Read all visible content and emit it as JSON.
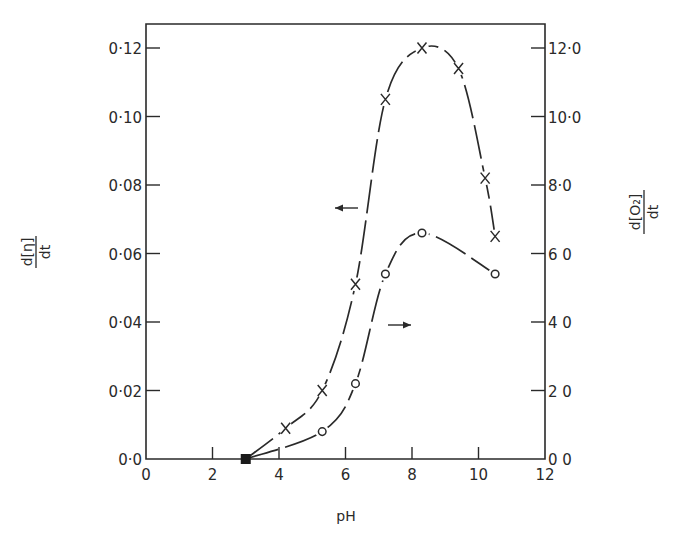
{
  "chart_data": {
    "type": "line",
    "title": "",
    "xlabel": "pH",
    "ylabel_left": "d[η]/dt",
    "ylabel_right": "d[O2]/dt",
    "xlim": [
      0,
      12
    ],
    "ylim_left": [
      0.0,
      0.12
    ],
    "ylim_right": [
      0.0,
      12.0
    ],
    "grid": false,
    "legend": "none (arrows indicate axis: ← left axis for X series, → right axis for O series)",
    "x_ticks": [
      "0",
      "2",
      "4",
      "6",
      "8",
      "10",
      "12"
    ],
    "y_ticks_left": [
      "0·0",
      "0·02",
      "0·04",
      "0·06",
      "0·08",
      "0·10",
      "0·12"
    ],
    "y_ticks_right": [
      "0 0",
      "2 0",
      "4 0",
      "6 0",
      "8·0",
      "10·0",
      "12·0"
    ],
    "series": [
      {
        "name": "d[η]/dt",
        "marker": "x",
        "axis": "left",
        "x": [
          3.0,
          4.2,
          5.3,
          6.3,
          7.2,
          8.3,
          9.4,
          10.2,
          10.5
        ],
        "values": [
          0.0,
          0.009,
          0.02,
          0.051,
          0.105,
          0.12,
          0.114,
          0.082,
          0.065
        ]
      },
      {
        "name": "d[O2]/dt",
        "marker": "o",
        "axis": "right",
        "x": [
          3.0,
          5.3,
          6.3,
          7.2,
          8.3,
          10.5
        ],
        "values": [
          0.0,
          0.8,
          2.2,
          5.4,
          6.6,
          5.4
        ]
      }
    ],
    "annotations": [
      {
        "type": "arrow",
        "direction": "left",
        "near": "X curve",
        "meaning": "read on left axis"
      },
      {
        "type": "arrow",
        "direction": "right",
        "near": "O curve",
        "meaning": "read on right axis"
      }
    ]
  },
  "labels": {
    "xlabel": "pH",
    "ylabel_left_num": "d[η]",
    "ylabel_left_den": "dt",
    "ylabel_right_num": "d[O₂]",
    "ylabel_right_den": "dt"
  }
}
